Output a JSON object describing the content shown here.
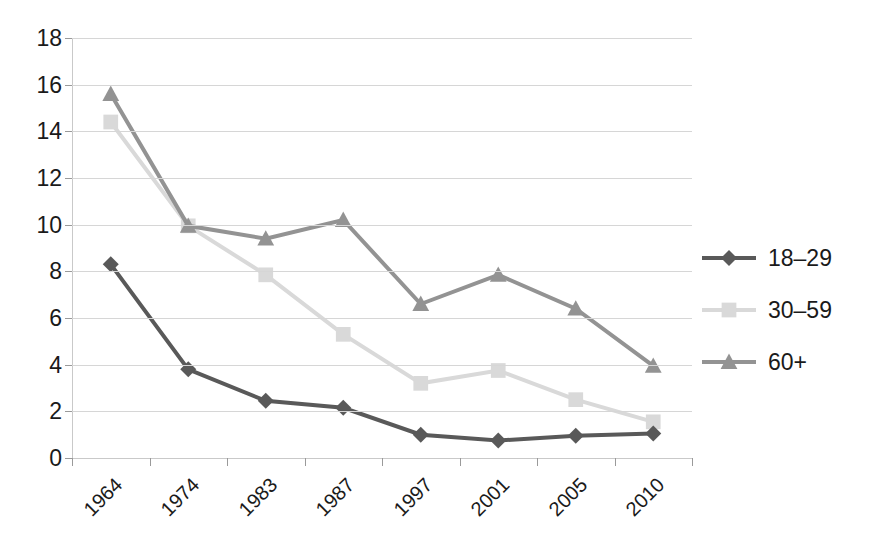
{
  "chart_data": {
    "type": "line",
    "title": "",
    "xlabel": "",
    "ylabel": "",
    "categories": [
      "1964",
      "1974",
      "1983",
      "1987",
      "1997",
      "2001",
      "2005",
      "2010"
    ],
    "ylim": [
      0,
      18
    ],
    "ytick_step": 2,
    "yticks": [
      "0",
      "2",
      "4",
      "6",
      "8",
      "10",
      "12",
      "14",
      "16",
      "18"
    ],
    "grid": true,
    "legend_position": "right",
    "series": [
      {
        "name": "18–29",
        "color": "#595959",
        "marker": "diamond",
        "values": [
          8.3,
          3.8,
          2.45,
          2.15,
          1.0,
          0.75,
          0.95,
          1.05
        ]
      },
      {
        "name": "30–59",
        "color": "#d9d9d9",
        "marker": "square",
        "values": [
          14.4,
          9.95,
          7.85,
          5.3,
          3.2,
          3.75,
          2.5,
          1.55
        ]
      },
      {
        "name": "60+",
        "color": "#939393",
        "marker": "triangle",
        "values": [
          15.6,
          9.95,
          9.4,
          10.2,
          6.6,
          7.85,
          6.4,
          3.95
        ]
      }
    ]
  },
  "legend": {
    "items": [
      {
        "label": "18–29"
      },
      {
        "label": "30–59"
      },
      {
        "label": "60+"
      }
    ]
  },
  "axes": {
    "y_labels": [
      "18",
      "16",
      "14",
      "12",
      "10",
      "8",
      "6",
      "4",
      "2",
      "0"
    ],
    "x_labels": [
      "1964",
      "1974",
      "1983",
      "1987",
      "1997",
      "2001",
      "2005",
      "2010"
    ]
  }
}
